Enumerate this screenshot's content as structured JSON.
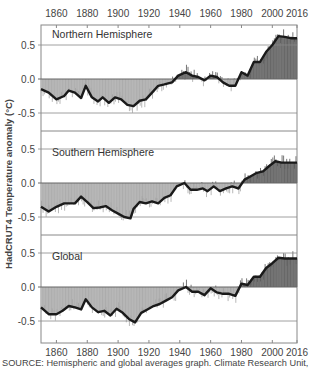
{
  "chart_data": {
    "type": "bar",
    "ylabel": "HadCRUT4 Temperature anomaly (°C)",
    "x_ticks": [
      "1860",
      "1880",
      "1900",
      "1920",
      "1940",
      "1960",
      "1980",
      "2000",
      "2016"
    ],
    "xlim": [
      1850,
      2016
    ],
    "source": "SOURCE: Hemispheric and global averages graph. Climate Research Unit, Univer-",
    "colors": {
      "negative": "#a6a6a6",
      "positive": "#5e5e5e",
      "smooth": "#1a1a1a",
      "grid": "#888888"
    },
    "panels": [
      {
        "title": "Northern Hemisphere",
        "y_ticks": [
          "0.5",
          "0.0",
          "-0.5"
        ],
        "ylim": [
          -0.8,
          0.8
        ],
        "smooth": [
          [
            1850,
            -0.15
          ],
          [
            1855,
            -0.2
          ],
          [
            1860,
            -0.3
          ],
          [
            1865,
            -0.25
          ],
          [
            1868,
            -0.17
          ],
          [
            1872,
            -0.2
          ],
          [
            1876,
            -0.28
          ],
          [
            1879,
            -0.1
          ],
          [
            1883,
            -0.27
          ],
          [
            1887,
            -0.33
          ],
          [
            1890,
            -0.27
          ],
          [
            1894,
            -0.35
          ],
          [
            1898,
            -0.27
          ],
          [
            1902,
            -0.3
          ],
          [
            1906,
            -0.38
          ],
          [
            1910,
            -0.4
          ],
          [
            1914,
            -0.32
          ],
          [
            1918,
            -0.3
          ],
          [
            1922,
            -0.2
          ],
          [
            1926,
            -0.1
          ],
          [
            1930,
            -0.08
          ],
          [
            1935,
            -0.05
          ],
          [
            1939,
            0.05
          ],
          [
            1944,
            0.1
          ],
          [
            1948,
            0.05
          ],
          [
            1952,
            0.03
          ],
          [
            1956,
            -0.02
          ],
          [
            1960,
            0.05
          ],
          [
            1964,
            0.03
          ],
          [
            1968,
            -0.05
          ],
          [
            1972,
            -0.1
          ],
          [
            1976,
            -0.1
          ],
          [
            1980,
            0.1
          ],
          [
            1984,
            0.05
          ],
          [
            1988,
            0.25
          ],
          [
            1992,
            0.25
          ],
          [
            1996,
            0.4
          ],
          [
            2000,
            0.5
          ],
          [
            2004,
            0.63
          ],
          [
            2008,
            0.62
          ],
          [
            2012,
            0.6
          ],
          [
            2016,
            0.6
          ]
        ]
      },
      {
        "title": "Southern Hemisphere",
        "y_ticks": [
          "0.5",
          "0.0",
          "-0.5"
        ],
        "ylim": [
          -0.8,
          0.8
        ],
        "smooth": [
          [
            1850,
            -0.35
          ],
          [
            1855,
            -0.42
          ],
          [
            1860,
            -0.35
          ],
          [
            1865,
            -0.3
          ],
          [
            1870,
            -0.3
          ],
          [
            1872,
            -0.3
          ],
          [
            1876,
            -0.2
          ],
          [
            1880,
            -0.28
          ],
          [
            1884,
            -0.37
          ],
          [
            1888,
            -0.36
          ],
          [
            1892,
            -0.34
          ],
          [
            1896,
            -0.4
          ],
          [
            1900,
            -0.45
          ],
          [
            1904,
            -0.5
          ],
          [
            1908,
            -0.52
          ],
          [
            1910,
            -0.38
          ],
          [
            1914,
            -0.28
          ],
          [
            1918,
            -0.3
          ],
          [
            1922,
            -0.27
          ],
          [
            1926,
            -0.3
          ],
          [
            1930,
            -0.22
          ],
          [
            1934,
            -0.18
          ],
          [
            1938,
            -0.05
          ],
          [
            1943,
            0.0
          ],
          [
            1947,
            -0.1
          ],
          [
            1951,
            -0.1
          ],
          [
            1955,
            -0.08
          ],
          [
            1958,
            -0.12
          ],
          [
            1962,
            -0.05
          ],
          [
            1966,
            -0.12
          ],
          [
            1970,
            -0.08
          ],
          [
            1974,
            -0.05
          ],
          [
            1978,
            -0.08
          ],
          [
            1982,
            0.05
          ],
          [
            1986,
            0.1
          ],
          [
            1990,
            0.15
          ],
          [
            1994,
            0.17
          ],
          [
            1998,
            0.25
          ],
          [
            2002,
            0.32
          ],
          [
            2006,
            0.3
          ],
          [
            2010,
            0.3
          ],
          [
            2016,
            0.3
          ]
        ]
      },
      {
        "title": "Global",
        "y_ticks": [
          "0.5",
          "0.0",
          "-0.5"
        ],
        "ylim": [
          -0.8,
          0.8
        ],
        "smooth": [
          [
            1850,
            -0.3
          ],
          [
            1855,
            -0.4
          ],
          [
            1860,
            -0.4
          ],
          [
            1864,
            -0.35
          ],
          [
            1868,
            -0.28
          ],
          [
            1872,
            -0.3
          ],
          [
            1876,
            -0.33
          ],
          [
            1879,
            -0.18
          ],
          [
            1883,
            -0.3
          ],
          [
            1887,
            -0.37
          ],
          [
            1891,
            -0.35
          ],
          [
            1895,
            -0.42
          ],
          [
            1899,
            -0.32
          ],
          [
            1903,
            -0.38
          ],
          [
            1907,
            -0.47
          ],
          [
            1911,
            -0.52
          ],
          [
            1915,
            -0.38
          ],
          [
            1919,
            -0.33
          ],
          [
            1923,
            -0.28
          ],
          [
            1927,
            -0.25
          ],
          [
            1931,
            -0.2
          ],
          [
            1935,
            -0.15
          ],
          [
            1939,
            -0.05
          ],
          [
            1944,
            0.0
          ],
          [
            1948,
            -0.07
          ],
          [
            1952,
            -0.07
          ],
          [
            1956,
            -0.12
          ],
          [
            1960,
            -0.02
          ],
          [
            1964,
            -0.08
          ],
          [
            1968,
            -0.1
          ],
          [
            1972,
            -0.1
          ],
          [
            1976,
            -0.13
          ],
          [
            1980,
            0.05
          ],
          [
            1984,
            0.03
          ],
          [
            1988,
            0.15
          ],
          [
            1992,
            0.15
          ],
          [
            1996,
            0.28
          ],
          [
            2000,
            0.35
          ],
          [
            2004,
            0.43
          ],
          [
            2008,
            0.42
          ],
          [
            2012,
            0.42
          ],
          [
            2016,
            0.42
          ]
        ]
      }
    ]
  }
}
